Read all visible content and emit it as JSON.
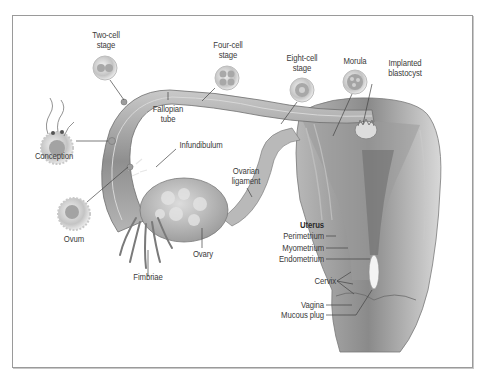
{
  "diagram": {
    "stages": [
      {
        "id": "two-cell",
        "label": "Two-cell\nstage"
      },
      {
        "id": "four-cell",
        "label": "Four-cell\nstage"
      },
      {
        "id": "eight-cell",
        "label": "Eight-cell\nstage"
      },
      {
        "id": "morula",
        "label": "Morula"
      },
      {
        "id": "implanted-blastocyst",
        "label": "Implanted\nblastocyst"
      }
    ],
    "labels": {
      "two_cell_1": "Two-cell",
      "two_cell_2": "stage",
      "four_cell_1": "Four-cell",
      "four_cell_2": "stage",
      "eight_cell_1": "Eight-cell",
      "eight_cell_2": "stage",
      "morula": "Morula",
      "blastocyst_1": "Implanted",
      "blastocyst_2": "blastocyst",
      "fallopian_1": "Fallopian",
      "fallopian_2": "tube",
      "conception": "Conception",
      "infundibulum": "Infundibulum",
      "ovarian_1": "Ovarian",
      "ovarian_2": "ligament",
      "ovum": "Ovum",
      "ovary": "Ovary",
      "fimbriae": "Fimbriae"
    },
    "uterus": {
      "heading": "Uterus",
      "layers": [
        "Perimetrium",
        "Myometrium",
        "Endometrium"
      ],
      "cervix": "Cervix",
      "vagina": "Vagina",
      "mucous_plug": "Mucous plug"
    },
    "colors": {
      "tissue": "#a9a9a9",
      "tissue_dark": "#7d7d7d",
      "tissue_light": "#cfcfcf",
      "label_text": "#3a3a3a",
      "frame": "#9a9a9a"
    }
  }
}
